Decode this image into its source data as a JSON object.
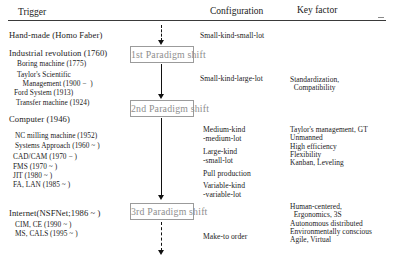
{
  "figure": {
    "columns": {
      "trigger": "Trigger",
      "configuration": "Configuration",
      "key_factor": "Key factor"
    }
  },
  "triggers": [
    {
      "major": "Hand-made (Homo Faber)",
      "items": []
    },
    {
      "major": "Industrial revolution (1760)",
      "items": [
        "Boring machine (1775)",
        "Taylor's Scientific",
        "   Management (1900 −  )",
        "Ford System (1913)",
        "Transfer machine (1924)"
      ]
    },
    {
      "major": "Computer (1946)",
      "items": [
        "NC milling machine (1952)",
        "Systems Approach (1960 ~ )",
        "CAD/CAM (1970 − )",
        "FMS (1970 ~ )",
        "JIT (1980 ~ )",
        "FA, LAN (1985 ~ )"
      ]
    },
    {
      "major": "Internet(NSFNet;1986 ~ )",
      "items": [
        "CIM, CE (1990 ~ )",
        "MS, CALS (1995 ~ )"
      ]
    }
  ],
  "paradigm_shifts": [
    {
      "label": "1st Paradigm shift"
    },
    {
      "label": "2nd Paradigm shift"
    },
    {
      "label": "3rd Paradigm shift"
    }
  ],
  "configurations": [
    {
      "lines": "Small-kind-small-lot"
    },
    {
      "lines": "Small-kind-large-lot"
    },
    {
      "lines": "Medium-kind\n-medium-lot"
    },
    {
      "lines": "Large-kind\n-small-lot"
    },
    {
      "lines": "Pull production"
    },
    {
      "lines": "Variable-kind\n-variable-lot"
    },
    {
      "lines": "Make-to order"
    }
  ],
  "key_factors": [
    {
      "lines": "Standardization,\n  Compatibility"
    },
    {
      "lines": "Taylor's management, GT\nUnmanned\nHigh efficiency\nFlexibility\nKanban, Leveling"
    },
    {
      "lines": "Human-centered,\n  Ergonomics, 3S\nAutonomous distributed\nEnvironmentally conscious\nAgile, Virtual"
    }
  ],
  "colors": {
    "ink": "#1a1a1a",
    "box_border": "#9b9b9b",
    "box_text": "#8e8e8e",
    "rule": "#3a3a3a",
    "arrow": "#111111",
    "background": "#ffffff"
  }
}
